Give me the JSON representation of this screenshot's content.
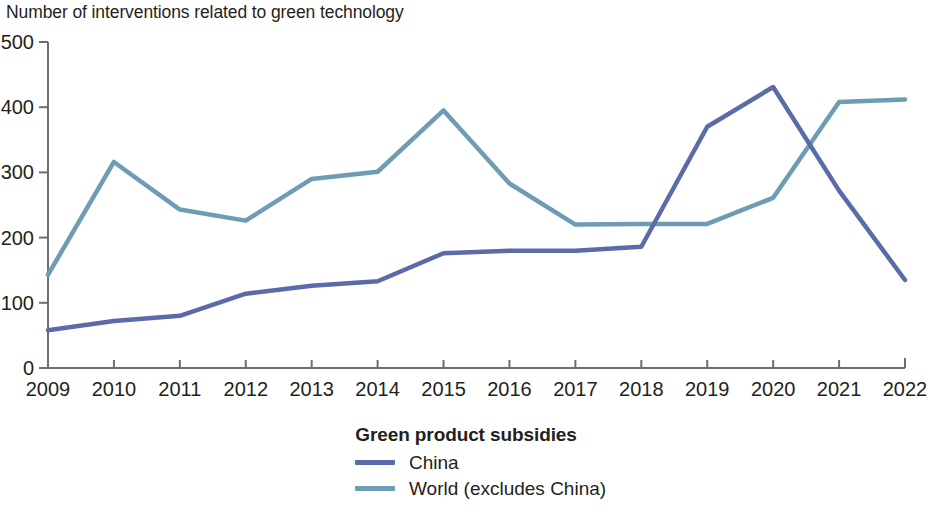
{
  "chart_data": {
    "type": "line",
    "title": "Number of interventions related to green technology",
    "xlabel": "",
    "ylabel": "",
    "categories": [
      "2009",
      "2010",
      "2011",
      "2012",
      "2013",
      "2014",
      "2015",
      "2016",
      "2017",
      "2018",
      "2019",
      "2020",
      "2021",
      "2022"
    ],
    "x": [
      2009,
      2010,
      2011,
      2012,
      2013,
      2014,
      2015,
      2016,
      2017,
      2018,
      2019,
      2020,
      2021,
      2022
    ],
    "series": [
      {
        "name": "China",
        "color": "#5b6ba8",
        "values": [
          58,
          72,
          80,
          114,
          126,
          133,
          176,
          180,
          180,
          186,
          370,
          431,
          272,
          135
        ]
      },
      {
        "name": "World (excludes China)",
        "color": "#6f9cb5",
        "values": [
          143,
          316,
          243,
          226,
          290,
          301,
          395,
          283,
          220,
          221,
          221,
          261,
          408,
          412
        ]
      }
    ],
    "ylim": [
      0,
      500
    ],
    "yticks": [
      0,
      100,
      200,
      300,
      400,
      500
    ],
    "ytick_labels": [
      "0",
      "100",
      "200",
      "300",
      "400",
      "500"
    ],
    "xtick_labels": [
      "2009",
      "2010",
      "2011",
      "2012",
      "2013",
      "2014",
      "2015",
      "2016",
      "2017",
      "2018",
      "2019",
      "2020",
      "2021",
      "2022"
    ],
    "grid": false,
    "legend_position": "bottom-center",
    "legend_title": "Green product subsidies",
    "legend_entries": [
      {
        "label": "China",
        "color": "#5b6ba8"
      },
      {
        "label": "World (excludes China)",
        "color": "#6f9cb5"
      }
    ]
  },
  "legend": {
    "title": "Green product subsidies",
    "items": [
      {
        "label": "China"
      },
      {
        "label": "World (excludes China)"
      }
    ]
  },
  "colors": {
    "china_line": "#5b6ba8",
    "world_line": "#6f9cb5",
    "axis": "#6d6e71",
    "text": "#231f20",
    "background": "#ffffff"
  }
}
